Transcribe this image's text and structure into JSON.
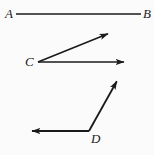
{
  "figure": {
    "background_color": "#fbfbfb",
    "stroke_color": "#1a1a1a",
    "width": 154,
    "height": 155,
    "labels": {
      "a": "A",
      "b": "B",
      "c": "C",
      "d": "D"
    },
    "shapes": [
      {
        "name": "segment-ab",
        "kind": "line-segment",
        "endpoints": [
          [
            16,
            14
          ],
          [
            141,
            14
          ]
        ],
        "arrowheads": "none",
        "labels": [
          "A",
          "B"
        ]
      },
      {
        "name": "angle-c-upper-ray",
        "kind": "ray",
        "from": [
          38,
          62
        ],
        "to": [
          110,
          33
        ],
        "arrowheads": "end",
        "vertex_label": "C"
      },
      {
        "name": "angle-c-horizontal-ray",
        "kind": "ray",
        "from": [
          38,
          62
        ],
        "to": [
          126,
          62
        ],
        "arrowheads": "end",
        "vertex_label": "C"
      },
      {
        "name": "angle-d-upper-ray",
        "kind": "ray",
        "from": [
          89,
          131
        ],
        "to": [
          118,
          79
        ],
        "arrowheads": "end",
        "vertex_label": "D"
      },
      {
        "name": "angle-d-left-ray",
        "kind": "ray",
        "from": [
          89,
          131
        ],
        "to": [
          30,
          131
        ],
        "arrowheads": "end",
        "vertex_label": "D"
      }
    ]
  }
}
